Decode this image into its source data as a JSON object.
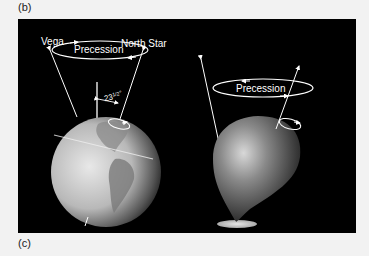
{
  "figure": {
    "top_label": "(b)",
    "bottom_label": "(c)"
  },
  "earth_diagram": {
    "star_left": "Vega",
    "star_right": "North Star",
    "motion_label": "Precession",
    "tilt_angle": "23½°",
    "tilt_whole": "23",
    "tilt_frac": "1/2",
    "tilt_deg": "°"
  },
  "top_diagram": {
    "motion_label": "Precession"
  },
  "colors": {
    "background": "#000000",
    "page": "#f2f2f2",
    "lines": "#ffffff"
  }
}
